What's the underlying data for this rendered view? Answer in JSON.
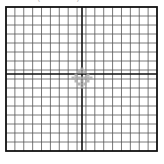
{
  "caption": "(· · · · ·)  · · · · · ·",
  "grid": {
    "left": 6,
    "top": 7,
    "right": 157,
    "bottom": 151,
    "cols": 17,
    "rows": 16,
    "center_x": 82,
    "center_y": 74,
    "line_color": "#555555",
    "axis_color": "#111111",
    "border_color": "#111111"
  },
  "marker": {
    "name": "center-cross-symbol",
    "color": "#aaaaaa"
  }
}
